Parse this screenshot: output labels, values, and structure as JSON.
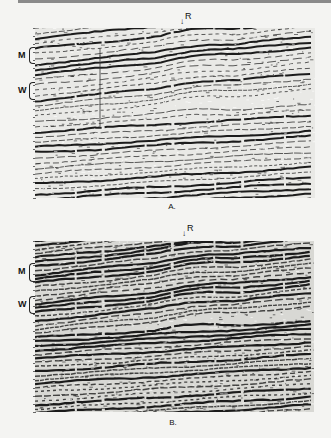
{
  "figure": {
    "panels": [
      {
        "id": "A",
        "caption": "A.",
        "marker_label": "R",
        "marker_arrow": "↓",
        "horizon_labels": [
          {
            "label": "M",
            "top": 47,
            "height": 15
          },
          {
            "label": "W",
            "top": 82,
            "height": 16
          }
        ],
        "style": "light",
        "tick_count": 22
      },
      {
        "id": "B",
        "caption": "B.",
        "marker_label": "R",
        "marker_arrow": "↓",
        "horizon_labels": [
          {
            "label": "M",
            "top": 263,
            "height": 17
          },
          {
            "label": "W",
            "top": 296,
            "height": 16
          }
        ],
        "style": "dark",
        "tick_count": 22
      }
    ],
    "colors": {
      "background": "#f4f4f2",
      "reflector": "#111111",
      "paper": "#e9e9e6"
    }
  }
}
